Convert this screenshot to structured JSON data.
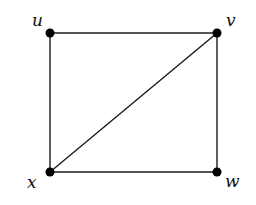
{
  "graph": {
    "nodes": [
      {
        "id": "u",
        "label": "u",
        "x": 50,
        "y": 33,
        "lx": 32,
        "ly": 26
      },
      {
        "id": "v",
        "label": "v",
        "x": 217,
        "y": 33,
        "lx": 226,
        "ly": 26
      },
      {
        "id": "x",
        "label": "x",
        "x": 50,
        "y": 172,
        "lx": 27,
        "ly": 188
      },
      {
        "id": "w",
        "label": "w",
        "x": 217,
        "y": 172,
        "lx": 225,
        "ly": 187
      }
    ],
    "edges": [
      {
        "from": "u",
        "to": "v"
      },
      {
        "from": "u",
        "to": "x"
      },
      {
        "from": "v",
        "to": "w"
      },
      {
        "from": "x",
        "to": "w"
      },
      {
        "from": "x",
        "to": "v"
      }
    ],
    "colors": {
      "edge": "#1a1a1a",
      "node": "#000000",
      "background": "#ffffff"
    }
  }
}
